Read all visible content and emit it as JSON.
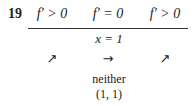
{
  "problem_number": "19",
  "columns": [
    {
      "condition": "f′ > 0",
      "arrow": "↗",
      "arrow_name": "increasing-arrow"
    },
    {
      "condition": "f′ = 0",
      "arrow": "→",
      "arrow_name": "flat-arrow"
    },
    {
      "condition": "f′ > 0",
      "arrow": "↗",
      "arrow_name": "increasing-arrow"
    }
  ],
  "critical_point": "x = 1",
  "classification": "neither",
  "point": "(1, 1)"
}
